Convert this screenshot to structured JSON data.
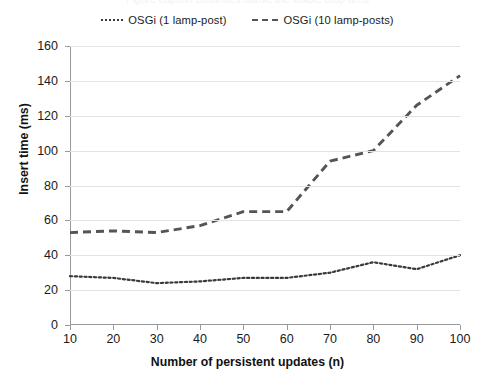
{
  "top_cut_text": "Figure caption continues above the visible crop area",
  "legend": {
    "position": "top-center",
    "items": [
      {
        "label": "OSGi (1 lamp-post)",
        "style": "dotted",
        "color": "#3a3a3a",
        "key_name": "legend-key-dotted"
      },
      {
        "label": "OSGi (10 lamp-posts)",
        "style": "dashed",
        "color": "#555555",
        "key_name": "legend-key-dashed"
      }
    ]
  },
  "axes": {
    "x": {
      "title": "Number of persistent updates (n)",
      "ticks": [
        10,
        20,
        30,
        40,
        50,
        60,
        70,
        80,
        90,
        100
      ],
      "min": 10,
      "max": 100
    },
    "y": {
      "title": "Insert time (ms)",
      "ticks": [
        0,
        20,
        40,
        60,
        80,
        100,
        120,
        140,
        160
      ],
      "min": 0,
      "max": 160
    }
  },
  "chart_data": {
    "type": "line",
    "title": "",
    "subtitle": "",
    "xlabel": "Number of persistent updates (n)",
    "ylabel": "Insert time (ms)",
    "x": [
      10,
      20,
      30,
      40,
      50,
      60,
      70,
      80,
      90,
      100
    ],
    "xlim": [
      10,
      100
    ],
    "ylim": [
      0,
      160
    ],
    "xticks": [
      10,
      20,
      30,
      40,
      50,
      60,
      70,
      80,
      90,
      100
    ],
    "yticks": [
      0,
      20,
      40,
      60,
      80,
      100,
      120,
      140,
      160
    ],
    "grid": "horizontal",
    "legend_position": "top-center",
    "series": [
      {
        "name": "OSGi (1 lamp-post)",
        "style": "dotted",
        "color": "#3a3a3a",
        "values": [
          28,
          27,
          24,
          25,
          27,
          27,
          30,
          36,
          32,
          40
        ]
      },
      {
        "name": "OSGi (10 lamp-posts)",
        "style": "dashed",
        "color": "#555555",
        "values": [
          53,
          54,
          53,
          57,
          65,
          65,
          94,
          100,
          126,
          143
        ]
      }
    ],
    "annotations": []
  },
  "colors": {
    "background": "#ffffff",
    "gridline": "#e3e3e3",
    "axis": "#9a9a9a",
    "text": "#1a1a1a"
  }
}
